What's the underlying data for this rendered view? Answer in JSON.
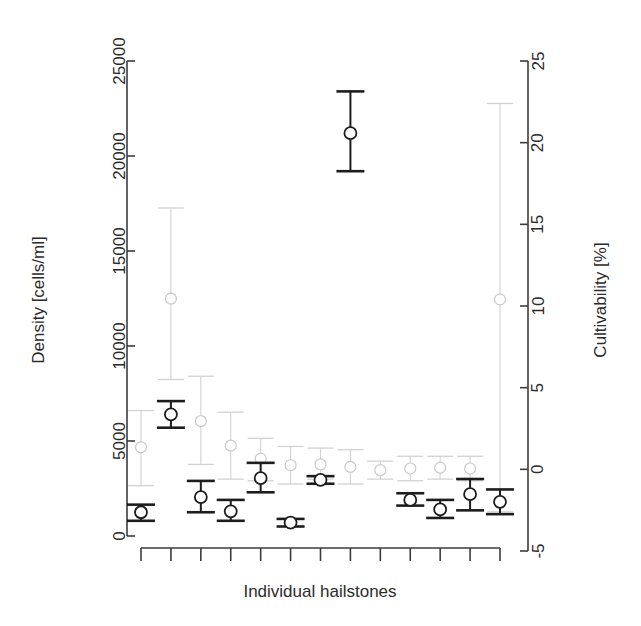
{
  "chart_data": {
    "type": "scatter",
    "title": "",
    "xlabel": "Individual hailstones",
    "ylabel": "Density [cells/ml]",
    "y2label": "Cultivability [%]",
    "grid": false,
    "legend": "none",
    "x": [
      1,
      2,
      3,
      4,
      5,
      6,
      7,
      8,
      9,
      10,
      11,
      12,
      13
    ],
    "xtick_labels": [
      "",
      "",
      "",
      "",
      "",
      "",
      "",
      "",
      "",
      "",
      "",
      "",
      ""
    ],
    "ylim": [
      0,
      25000
    ],
    "yticks": [
      0,
      5000,
      10000,
      15000,
      20000,
      25000
    ],
    "ytick_labels": [
      "0",
      "5000",
      "10000",
      "15000",
      "20000",
      "25000"
    ],
    "y2lim": [
      -5,
      25
    ],
    "y2ticks": [
      -5,
      0,
      5,
      10,
      15,
      20,
      25
    ],
    "y2tick_labels": [
      "-5",
      "0",
      "5",
      "10",
      "15",
      "20",
      "25"
    ],
    "series": [
      {
        "name": "Density [cells/ml]",
        "axis": "left",
        "color": "#1d1d1d",
        "marker": "circle",
        "values": [
          1250,
          6400,
          2050,
          1300,
          3050,
          700,
          2950,
          21200,
          null,
          1900,
          1400,
          2200,
          1800
        ],
        "err_low": [
          800,
          5700,
          1250,
          800,
          2300,
          500,
          2750,
          19200,
          null,
          1600,
          950,
          1350,
          1150
        ],
        "err_high": [
          1650,
          7100,
          2900,
          1900,
          3850,
          900,
          3150,
          23400,
          null,
          2250,
          1900,
          3000,
          2450
        ]
      },
      {
        "name": "Cultivability [%]",
        "axis": "right",
        "color": "#c9c9c9",
        "marker": "circle",
        "values": [
          1.35,
          10.45,
          2.95,
          1.45,
          0.65,
          0.25,
          0.3,
          0.15,
          -0.05,
          0.05,
          0.1,
          0.05,
          10.4
        ],
        "err_low": [
          -1.0,
          5.5,
          0.3,
          -0.6,
          -0.7,
          -0.9,
          -0.6,
          -0.9,
          -0.6,
          -0.7,
          -0.6,
          -0.7,
          -2.6
        ],
        "err_high": [
          3.6,
          16.0,
          5.7,
          3.5,
          1.9,
          1.4,
          1.3,
          1.2,
          0.5,
          0.8,
          0.8,
          0.8,
          22.4
        ]
      }
    ]
  },
  "figure": {
    "background": "#ffffff",
    "axis_color": "#3c3c3c",
    "dark_series_color": "#1d1d1d",
    "light_series_color": "#c9c9c9"
  }
}
